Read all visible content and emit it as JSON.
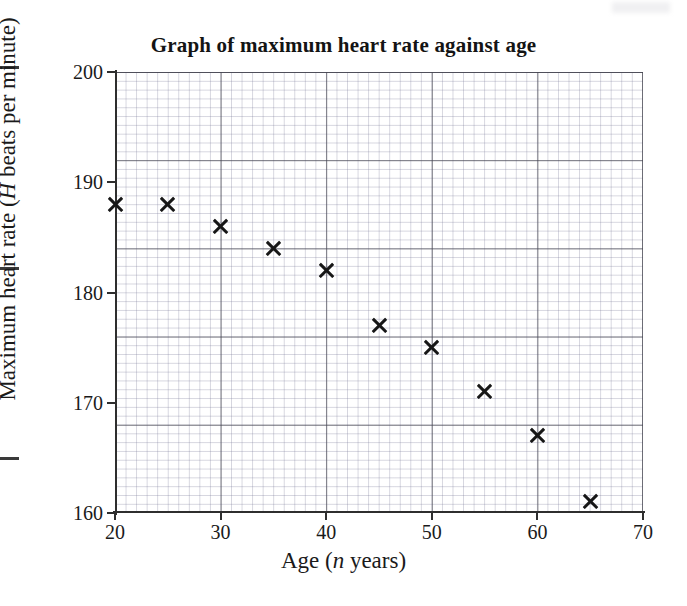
{
  "chart_data": {
    "type": "scatter",
    "title": "Graph of maximum heart rate against age",
    "xlabel": "Age (n years)",
    "ylabel": "Maximum heart rate (H beats per minute)",
    "xlabel_parts": {
      "pre": "Age (",
      "italic": "n",
      "post": " years)"
    },
    "ylabel_parts": {
      "pre": "Maximum heart rate (",
      "italic": "H",
      "post": " beats per minute)"
    },
    "x": [
      20,
      25,
      30,
      35,
      40,
      45,
      50,
      55,
      60,
      65
    ],
    "values": [
      188,
      188,
      186,
      184,
      182,
      177,
      175,
      171,
      167,
      161
    ],
    "points": [
      {
        "x": 20,
        "y": 188
      },
      {
        "x": 25,
        "y": 188
      },
      {
        "x": 30,
        "y": 186
      },
      {
        "x": 35,
        "y": 184
      },
      {
        "x": 40,
        "y": 182
      },
      {
        "x": 45,
        "y": 177
      },
      {
        "x": 50,
        "y": 175
      },
      {
        "x": 55,
        "y": 171
      },
      {
        "x": 60,
        "y": 167
      },
      {
        "x": 65,
        "y": 161
      }
    ],
    "xlim": [
      20,
      70
    ],
    "ylim": [
      160,
      200
    ],
    "xticks": [
      "20",
      "30",
      "40",
      "50",
      "60",
      "70"
    ],
    "xtick_values": [
      20,
      30,
      40,
      50,
      60,
      70
    ],
    "yticks": [
      "160",
      "170",
      "180",
      "190",
      "200"
    ],
    "ytick_values": [
      160,
      170,
      180,
      190,
      200
    ],
    "x_minor_step": 1,
    "y_minor_step": 1,
    "grid": true,
    "legend": "none",
    "marker": "cross",
    "marker_color": "#171717"
  },
  "colors": {
    "ink": "#1a1a1a",
    "axis": "#2e2e2e",
    "grid_major": "rgba(70,70,80,0.70)",
    "grid_minor": "rgba(120,120,150,0.30)",
    "background": "#ffffff"
  }
}
